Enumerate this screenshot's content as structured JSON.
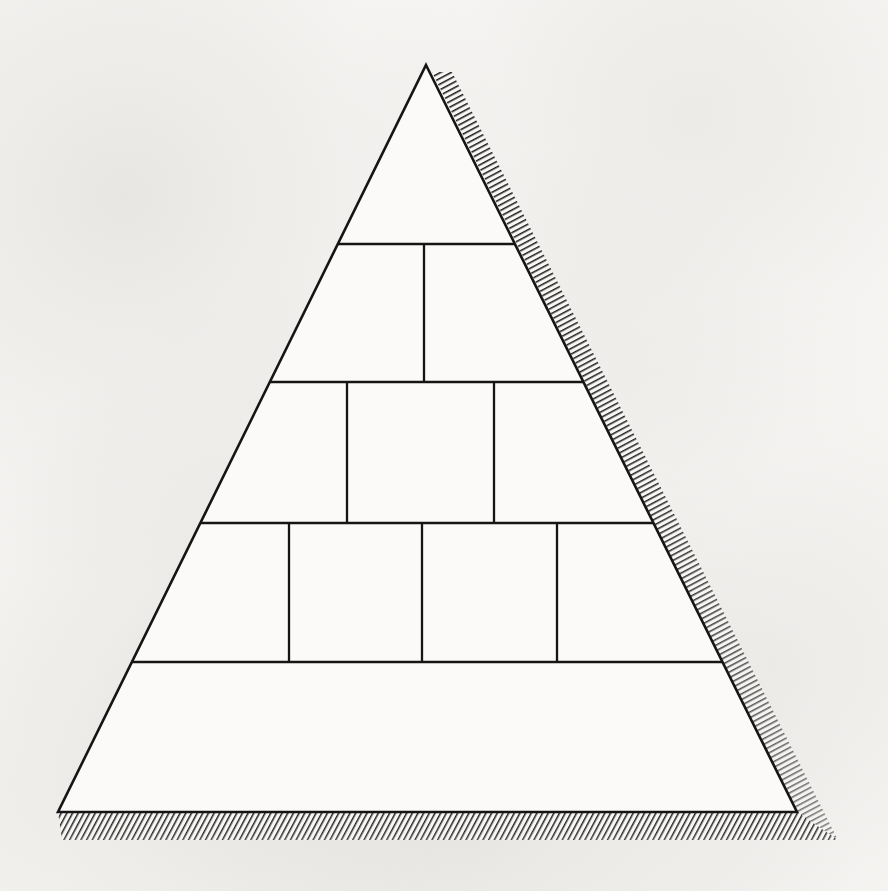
{
  "figure": {
    "type": "layered-pyramid",
    "caption": "",
    "background_color": "#f8f7f5",
    "stroke_color": "#151515",
    "fill_color": "#fbfaf8",
    "shadow_color": "#1a1a1a",
    "apex": {
      "x": 426,
      "y": 65
    },
    "base_left": {
      "x": 58,
      "y": 812
    },
    "base_right": {
      "x": 797,
      "y": 812
    },
    "tier_count": 5,
    "tier_boundaries_y": [
      244,
      382,
      523,
      662
    ],
    "shadow": {
      "style": "diagonal-hatch",
      "right_band_width": 17,
      "bottom_band_height": 28,
      "offset_x": 14,
      "offset_y": 14
    },
    "tiers": [
      {
        "index": 1,
        "name": "tier-1-apex",
        "label": "",
        "y_top": 65,
        "y_bottom": 244,
        "cell_count": 1,
        "dividers_x": [],
        "cells": [
          {
            "name": "tier-1-cell-1",
            "label": ""
          }
        ]
      },
      {
        "index": 2,
        "name": "tier-2",
        "label": "",
        "y_top": 244,
        "y_bottom": 382,
        "cell_count": 2,
        "dividers_x": [
          424
        ],
        "cells": [
          {
            "name": "tier-2-cell-1",
            "label": ""
          },
          {
            "name": "tier-2-cell-2",
            "label": ""
          }
        ]
      },
      {
        "index": 3,
        "name": "tier-3",
        "label": "",
        "y_top": 382,
        "y_bottom": 523,
        "cell_count": 3,
        "dividers_x": [
          347,
          494
        ],
        "cells": [
          {
            "name": "tier-3-cell-1",
            "label": ""
          },
          {
            "name": "tier-3-cell-2",
            "label": ""
          },
          {
            "name": "tier-3-cell-3",
            "label": ""
          }
        ]
      },
      {
        "index": 4,
        "name": "tier-4",
        "label": "",
        "y_top": 523,
        "y_bottom": 662,
        "cell_count": 4,
        "dividers_x": [
          289,
          422,
          557
        ],
        "cells": [
          {
            "name": "tier-4-cell-1",
            "label": ""
          },
          {
            "name": "tier-4-cell-2",
            "label": ""
          },
          {
            "name": "tier-4-cell-3",
            "label": ""
          },
          {
            "name": "tier-4-cell-4",
            "label": ""
          }
        ]
      },
      {
        "index": 5,
        "name": "tier-5-base",
        "label": "",
        "y_top": 662,
        "y_bottom": 812,
        "cell_count": 1,
        "dividers_x": [],
        "cells": [
          {
            "name": "tier-5-cell-1",
            "label": ""
          }
        ]
      }
    ]
  }
}
